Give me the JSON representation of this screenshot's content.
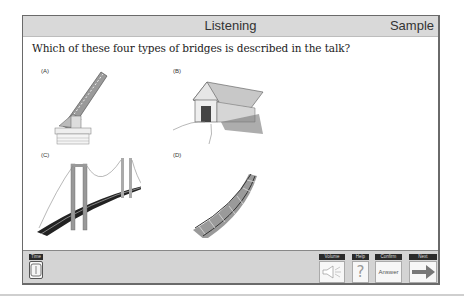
{
  "header": {
    "title": "Listening",
    "right_label": "Sample"
  },
  "question": "Which of these four types of bridges is described in the talk?",
  "options": [
    {
      "label": "(A)",
      "image": "drawbridge-image"
    },
    {
      "label": "(B)",
      "image": "covered-bridge-image"
    },
    {
      "label": "(C)",
      "image": "suspension-bridge-image"
    },
    {
      "label": "(D)",
      "image": "railway-track-image"
    }
  ],
  "toolbar": {
    "time_label": "Time",
    "volume_label": "Volume",
    "help_label": "Help",
    "help_glyph": "?",
    "confirm_label": "Confirm",
    "answer_label": "Answer",
    "next_label": "Next"
  }
}
